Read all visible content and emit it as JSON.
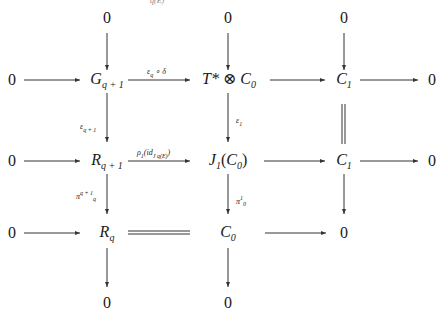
{
  "diagram": {
    "type": "commutative-diagram",
    "top_clipped_text": "q(E)",
    "rows": [
      {
        "name": "top-zeros",
        "nodes": [
          "0",
          "0",
          "0"
        ]
      },
      {
        "name": "row-G",
        "nodes": [
          "0",
          "G_{q+1}",
          "T*⊗C_0",
          "C_1",
          "0"
        ]
      },
      {
        "name": "row-R",
        "nodes": [
          "0",
          "R_{q+1}",
          "J_1(C_0)",
          "C_1",
          "0"
        ]
      },
      {
        "name": "row-Rq",
        "nodes": [
          "0",
          "R_q",
          "C_0",
          "0"
        ]
      },
      {
        "name": "bottom-zeros",
        "nodes": [
          "0",
          "0"
        ]
      }
    ],
    "nodes": {
      "zero": "0",
      "G_base": "G",
      "G_sub": "q + 1",
      "T_star": "T*",
      "otimes": "⊗",
      "C": "C",
      "sub0": "0",
      "sub1": "1",
      "R_base": "R",
      "R_sub_q1": "q + 1",
      "R_sub_q": "q",
      "J": "J",
      "J_open": "(",
      "J_close": ")"
    },
    "arrow_labels": {
      "eps_q_delta": "ε_q ∘ δ",
      "eps_q1": "ε_{q+1}",
      "rho1": "ρ_1(id_{J_q(E)})",
      "eps1": "ε_1",
      "pi_q1_q": "π_q^{q+1}",
      "pi_1_0": "π_0^1"
    },
    "labels_render": {
      "eps_q_delta": {
        "base": "ε",
        "sub": "q",
        "rest": " ∘ δ"
      },
      "eps_q1": {
        "base": "ε",
        "sub": "q + 1"
      },
      "rho1": {
        "base": "ρ",
        "sub": "1",
        "mid": "(id",
        "sub2": "J q(E)",
        "end": ")"
      },
      "eps1": {
        "base": "ε",
        "sub": "1"
      },
      "pi_q1_q": {
        "base": "π",
        "sup": "q + 1",
        "sub": "q"
      },
      "pi_1_0": {
        "base": "π",
        "sup": "1",
        "sub": "0"
      }
    },
    "equalities": [
      "R_q = C_0 (double line)",
      "C_1 = C_1 (vertical double line)"
    ]
  }
}
